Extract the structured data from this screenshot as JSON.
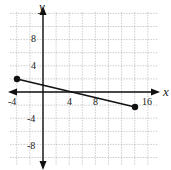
{
  "graph": {
    "x_axis_label": "x",
    "y_axis_label": "y",
    "x_ticks": [
      {
        "value": -4,
        "label": "-4"
      },
      {
        "value": 4,
        "label": "4"
      },
      {
        "value": 8,
        "label": "8"
      },
      {
        "value": 16,
        "label": "16"
      }
    ],
    "y_ticks": [
      {
        "value": 8,
        "label": "8"
      },
      {
        "value": 4,
        "label": "4"
      },
      {
        "value": -4,
        "label": "-4"
      },
      {
        "value": -8,
        "label": "-8"
      }
    ],
    "grid_step": 2,
    "segment": {
      "start": [
        -4,
        2
      ],
      "end": [
        14,
        -2
      ]
    },
    "colors": {
      "grid": "#999999",
      "axis": "#111111",
      "segment": "#111111"
    }
  }
}
